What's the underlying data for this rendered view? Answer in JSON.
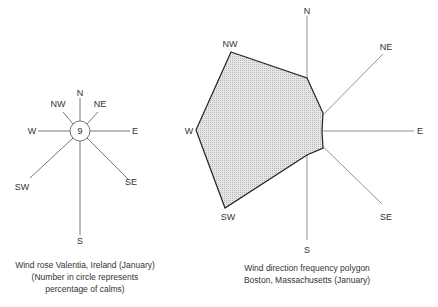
{
  "wind_rose": {
    "directions": [
      "N",
      "NE",
      "E",
      "SE",
      "S",
      "SW",
      "W",
      "NW"
    ],
    "calm_percentage": "9",
    "caption": {
      "line1": "Wind rose  Valentia, Ireland (January)",
      "line2": "(Number in circle represents",
      "line3": "percentage of  calms)"
    }
  },
  "frequency_polygon": {
    "directions": [
      "N",
      "NE",
      "E",
      "SE",
      "S",
      "SW",
      "W",
      "NW"
    ],
    "fill_color": "#d9d9d9",
    "caption": {
      "line1": "Wind direction frequency polygon",
      "line2": "Boston, Massachusetts (January)"
    }
  },
  "labels": {
    "N": "N",
    "NE": "NE",
    "E": "E",
    "SE": "SE",
    "S": "S",
    "SW": "SW",
    "W": "W",
    "NW": "NW"
  }
}
